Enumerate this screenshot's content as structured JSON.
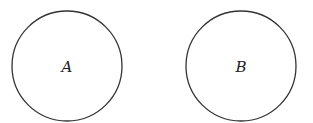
{
  "diagram": {
    "shapes": [
      {
        "id": "circle-a",
        "label": "A",
        "cx": 67,
        "cy": 66,
        "r": 55
      },
      {
        "id": "circle-b",
        "label": "B",
        "cx": 241,
        "cy": 66,
        "r": 55
      }
    ],
    "stroke_color": "#333333"
  }
}
